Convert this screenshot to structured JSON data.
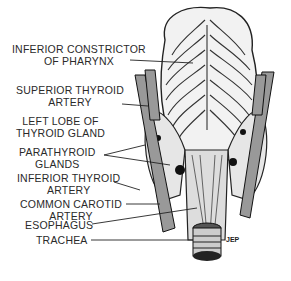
{
  "figure": {
    "type": "anatomical-illustration",
    "signature": "JEP"
  },
  "labels": [
    {
      "id": "inferior-constrictor",
      "lines": [
        "INFERIOR CONSTRICTOR",
        "OF PHARYNX"
      ]
    },
    {
      "id": "superior-thyroid-artery",
      "lines": [
        "SUPERIOR THYROID",
        "ARTERY"
      ]
    },
    {
      "id": "left-lobe-thyroid",
      "lines": [
        "LEFT LOBE OF",
        "THYROID GLAND"
      ]
    },
    {
      "id": "parathyroid-glands",
      "lines": [
        "PARATHYROID",
        "GLANDS"
      ]
    },
    {
      "id": "inferior-thyroid-artery",
      "lines": [
        "INFERIOR THYROID",
        "ARTERY"
      ]
    },
    {
      "id": "common-carotid-artery",
      "lines": [
        "COMMON CAROTID",
        "ARTERY"
      ]
    },
    {
      "id": "esophagus",
      "lines": [
        "ESOPHAGUS"
      ]
    },
    {
      "id": "trachea",
      "lines": [
        "TRACHEA"
      ]
    }
  ]
}
